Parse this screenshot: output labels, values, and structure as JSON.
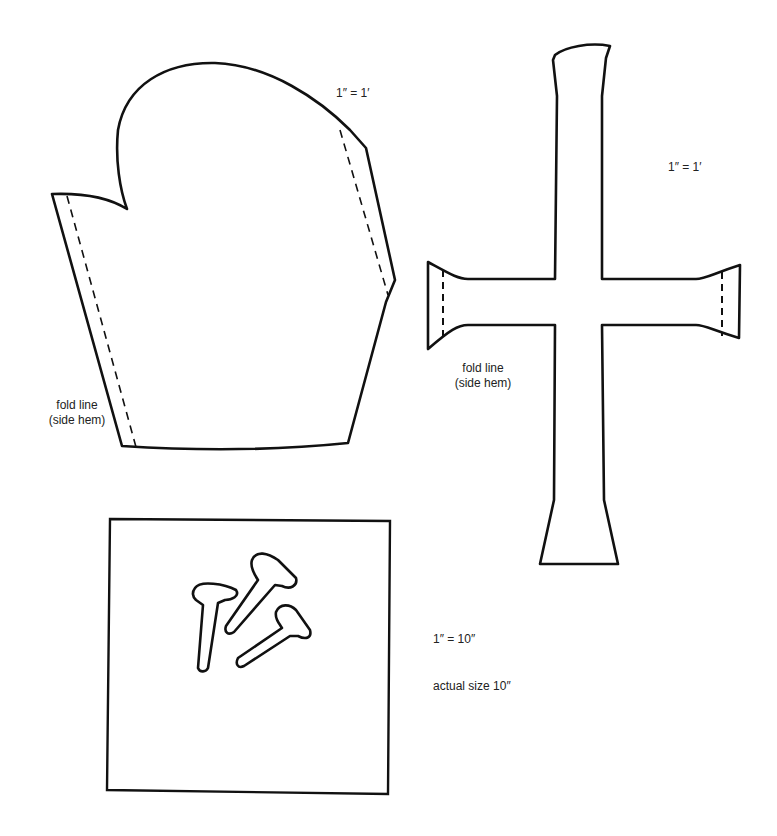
{
  "colors": {
    "ink": "#111111",
    "text": "#222222",
    "paper": "#ffffff"
  },
  "patterns": {
    "robe": {
      "scale_label": "1″ = 1′",
      "fold_label_line1": "fold line",
      "fold_label_line2": "(side hem)"
    },
    "cross": {
      "scale_label": "1″ = 1′",
      "fold_label_line1": "fold line",
      "fold_label_line2": "(side hem)"
    },
    "nails": {
      "count": 3,
      "scale_label": "1″ = 10″",
      "size_label": "actual size 10″"
    }
  }
}
